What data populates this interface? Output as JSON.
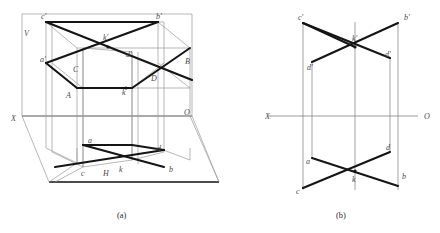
{
  "figure": {
    "captions": {
      "a": "(a)",
      "b": "(b)"
    }
  },
  "figure_a": {
    "name": "pictorial-projection-view",
    "plane_labels": {
      "vertical_plane": "V",
      "horizontal_plane": "H",
      "x_axis": "X",
      "origin": "O"
    },
    "space_point_labels": {
      "A": "A",
      "B": "B",
      "C": "C",
      "D": "D"
    },
    "front_view_labels": {
      "a_prime": "a'",
      "b_prime": "b'",
      "c_prime": "c'",
      "d_prime": "d'",
      "k_prime": "k'"
    },
    "top_view_labels": {
      "a": "a",
      "b": "b",
      "c": "c",
      "d": "d",
      "k": "k"
    },
    "visible_front_labels": [
      "V",
      "c'",
      "k'",
      "b'",
      "d'",
      "d'",
      "B",
      "C",
      "A",
      "D",
      "O",
      "X",
      "a",
      "c",
      "k",
      "d",
      "b",
      "H"
    ]
  },
  "figure_b": {
    "name": "two-view-orthographic-drawing",
    "axis_labels": {
      "x_left": "X",
      "o_right": "O"
    },
    "front_view_labels": {
      "c_prime": "c'",
      "k_prime": "k'",
      "b_prime": "b'",
      "d_prime": "d'",
      "a_prime": "a'"
    },
    "top_view_labels": {
      "a": "a",
      "d": "d",
      "k": "k",
      "c": "c",
      "b": "b"
    },
    "visible_labels": [
      "c'",
      "k'",
      "b'",
      "d'",
      "X",
      "O",
      "a",
      "d",
      "k",
      "c",
      "b"
    ]
  },
  "colors": {
    "thick_line": "#151515",
    "thin_line": "#9a9a9a",
    "axis_line": "#8e8e8e",
    "label_text": "#4a4a4a",
    "caption_text": "#2b2b2b",
    "background": "#ffffff"
  }
}
